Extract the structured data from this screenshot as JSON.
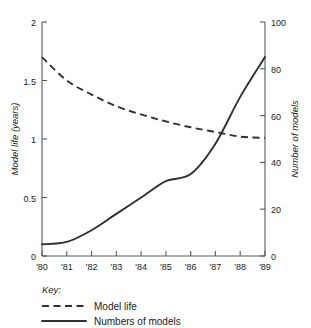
{
  "chart_data": {
    "type": "line",
    "title": "",
    "xlabel": "",
    "ylabel": "Model life (years)",
    "y2label": "Number of models",
    "grid": false,
    "legend_position": "below-left",
    "legend_title": "Key:",
    "x": [
      "'80",
      "'81",
      "'82",
      "'83",
      "'84",
      "'85",
      "'86",
      "'87",
      "'88",
      "'89"
    ],
    "xlim": [
      1980,
      1989
    ],
    "ylim": [
      0,
      2
    ],
    "y2lim": [
      0,
      100
    ],
    "yticks": [
      "0",
      "0.5",
      "1",
      "1.5",
      "2"
    ],
    "ytick_values": [
      0,
      0.5,
      1,
      1.5,
      2
    ],
    "y2ticks": [
      "0",
      "20",
      "40",
      "60",
      "80",
      "100"
    ],
    "y2tick_values": [
      0,
      20,
      40,
      60,
      80,
      100
    ],
    "series": [
      {
        "name": "Model life",
        "style": "dashed",
        "axis": "left",
        "units": "years",
        "values": [
          1.7,
          1.5,
          1.38,
          1.28,
          1.21,
          1.15,
          1.1,
          1.06,
          1.02,
          1.01
        ]
      },
      {
        "name": "Numbers of models",
        "style": "solid",
        "axis": "right",
        "units": "models",
        "values": [
          5,
          6,
          11,
          18,
          25,
          32,
          35,
          48,
          68,
          85
        ]
      }
    ]
  },
  "axes": {
    "left_title": "Model life (years)",
    "right_title": "Number of models",
    "left_ticks": [
      "2",
      "1.5",
      "1",
      "0.5",
      "0"
    ],
    "right_ticks": [
      "100",
      "80",
      "60",
      "40",
      "20",
      "0"
    ],
    "x_ticks": [
      "'80",
      "'81",
      "'82",
      "'83",
      "'84",
      "'85",
      "'86",
      "'87",
      "'88",
      "'89"
    ]
  },
  "key": {
    "title": "Key:",
    "entries": [
      {
        "label": "Model life",
        "style": "dashed"
      },
      {
        "label": "Numbers of models",
        "style": "solid"
      }
    ]
  },
  "colors": {
    "ink": "#2e3134",
    "axis": "#555a5e",
    "background": "#ffffff"
  }
}
